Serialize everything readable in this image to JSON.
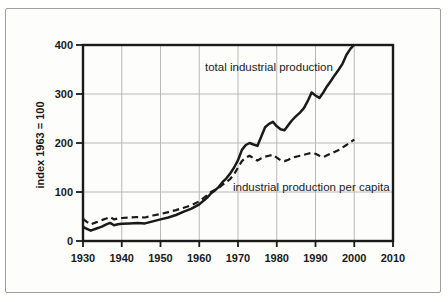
{
  "figure": {
    "y_axis_title": "index 1963 = 100"
  },
  "chart_data": {
    "type": "line",
    "title": "",
    "xlabel": "",
    "ylabel": "index 1963 = 100",
    "xlim": [
      1930,
      2010
    ],
    "ylim": [
      0,
      400
    ],
    "x_ticks": [
      1930,
      1940,
      1950,
      1960,
      1970,
      1980,
      1990,
      2000,
      2010
    ],
    "y_ticks": [
      0,
      100,
      200,
      300,
      400
    ],
    "grid": true,
    "legend_position": "inline-annotations",
    "colors": {
      "line": "#1a1a1a",
      "grid": "#b9b9b9",
      "frame_border": "#9f9f9f",
      "background": "#fdfdfb"
    },
    "series": [
      {
        "name": "total industrial production",
        "style": "solid",
        "points": [
          [
            1930,
            29
          ],
          [
            1931,
            25
          ],
          [
            1932,
            21
          ],
          [
            1933,
            24
          ],
          [
            1934,
            27
          ],
          [
            1935,
            30
          ],
          [
            1936,
            34
          ],
          [
            1937,
            37
          ],
          [
            1938,
            32
          ],
          [
            1939,
            34
          ],
          [
            1940,
            35
          ],
          [
            1942,
            36
          ],
          [
            1944,
            37
          ],
          [
            1946,
            36
          ],
          [
            1948,
            40
          ],
          [
            1950,
            44
          ],
          [
            1952,
            48
          ],
          [
            1954,
            53
          ],
          [
            1956,
            60
          ],
          [
            1958,
            66
          ],
          [
            1960,
            75
          ],
          [
            1962,
            88
          ],
          [
            1963,
            97
          ],
          [
            1964,
            103
          ],
          [
            1965,
            110
          ],
          [
            1966,
            120
          ],
          [
            1967,
            128
          ],
          [
            1968,
            138
          ],
          [
            1969,
            150
          ],
          [
            1970,
            165
          ],
          [
            1971,
            186
          ],
          [
            1972,
            196
          ],
          [
            1973,
            200
          ],
          [
            1974,
            197
          ],
          [
            1975,
            194
          ],
          [
            1976,
            213
          ],
          [
            1977,
            232
          ],
          [
            1978,
            239
          ],
          [
            1979,
            243
          ],
          [
            1980,
            234
          ],
          [
            1981,
            228
          ],
          [
            1982,
            226
          ],
          [
            1983,
            237
          ],
          [
            1984,
            247
          ],
          [
            1985,
            255
          ],
          [
            1986,
            262
          ],
          [
            1987,
            271
          ],
          [
            1988,
            286
          ],
          [
            1989,
            303
          ],
          [
            1990,
            297
          ],
          [
            1991,
            292
          ],
          [
            1992,
            303
          ],
          [
            1993,
            316
          ],
          [
            1994,
            327
          ],
          [
            1995,
            339
          ],
          [
            1996,
            350
          ],
          [
            1997,
            362
          ],
          [
            1998,
            380
          ],
          [
            1999,
            392
          ],
          [
            2000,
            401
          ]
        ]
      },
      {
        "name": "industrial production per capita",
        "style": "dashed",
        "points": [
          [
            1930,
            45
          ],
          [
            1931,
            39
          ],
          [
            1932,
            34
          ],
          [
            1933,
            37
          ],
          [
            1934,
            40
          ],
          [
            1935,
            43
          ],
          [
            1936,
            46
          ],
          [
            1937,
            49
          ],
          [
            1938,
            44
          ],
          [
            1939,
            46
          ],
          [
            1940,
            47
          ],
          [
            1942,
            48
          ],
          [
            1944,
            49
          ],
          [
            1946,
            48
          ],
          [
            1948,
            52
          ],
          [
            1950,
            55
          ],
          [
            1952,
            59
          ],
          [
            1954,
            63
          ],
          [
            1956,
            68
          ],
          [
            1958,
            73
          ],
          [
            1960,
            81
          ],
          [
            1962,
            93
          ],
          [
            1963,
            100
          ],
          [
            1964,
            104
          ],
          [
            1965,
            108
          ],
          [
            1966,
            115
          ],
          [
            1967,
            120
          ],
          [
            1968,
            127
          ],
          [
            1969,
            136
          ],
          [
            1970,
            150
          ],
          [
            1971,
            163
          ],
          [
            1972,
            170
          ],
          [
            1973,
            174
          ],
          [
            1974,
            169
          ],
          [
            1975,
            164
          ],
          [
            1976,
            169
          ],
          [
            1977,
            172
          ],
          [
            1978,
            174
          ],
          [
            1979,
            176
          ],
          [
            1980,
            170
          ],
          [
            1981,
            165
          ],
          [
            1982,
            163
          ],
          [
            1983,
            166
          ],
          [
            1984,
            170
          ],
          [
            1985,
            172
          ],
          [
            1986,
            174
          ],
          [
            1987,
            176
          ],
          [
            1988,
            178
          ],
          [
            1989,
            180
          ],
          [
            1990,
            178
          ],
          [
            1991,
            174
          ],
          [
            1992,
            171
          ],
          [
            1993,
            175
          ],
          [
            1994,
            179
          ],
          [
            1995,
            182
          ],
          [
            1996,
            186
          ],
          [
            1997,
            191
          ],
          [
            1998,
            196
          ],
          [
            1999,
            202
          ],
          [
            2000,
            207
          ]
        ]
      }
    ]
  }
}
